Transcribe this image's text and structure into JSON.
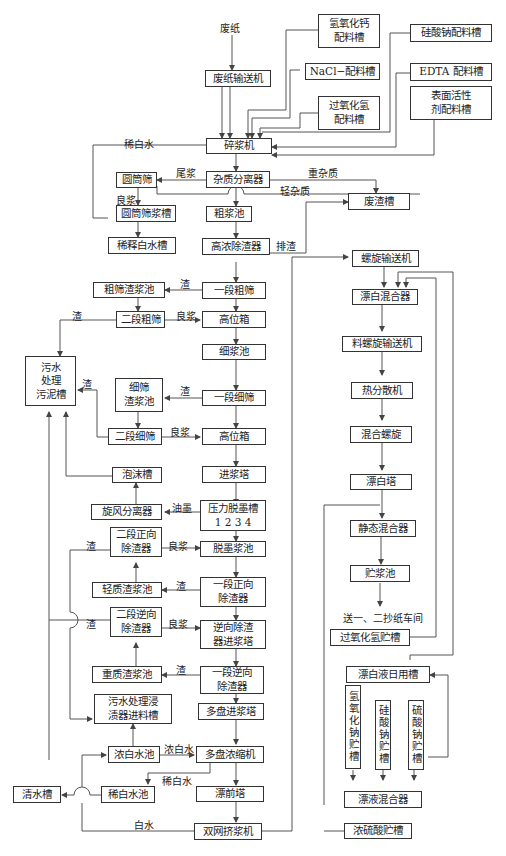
{
  "diagram": {
    "type": "process-flow"
  },
  "inputs": {
    "waste_paper": "废纸",
    "calcium_hydroxide_tank": "氢氧化钙\n配料槽",
    "sodium_silicate_tank": "硅酸钠配料槽",
    "nacl_tank": "NaCl−配料槽",
    "edta_tank": "EDTA 配料槽",
    "hydrogen_peroxide_tank": "过氧化氢\n配料槽",
    "surfactant_tank": "表面活性\n剂配料槽"
  },
  "left_chain": {
    "waste_paper_conveyor": "废纸输送机",
    "pulper": "碎浆机",
    "impurity_separator": "杂质分离器",
    "drum_screen": "圆筒筛",
    "drum_screen_chest": "圆筒筛浆槽",
    "dilution_water_tank": "稀释白水槽",
    "crude_pulp_pool": "粗浆池",
    "hd_cleaner": "高浓除渣器",
    "waste_residue_tank": "废渣槽",
    "coarse_screen_1": "一段粗筛",
    "coarse_reject_pool": "粗筛渣浆池",
    "coarse_screen_2": "二段粗筛",
    "headbox_1": "高位箱",
    "fine_pulp_pool": "细浆池",
    "sludge_tank": "污水\n处理\n污泥槽",
    "fine_reject_pool": "细筛\n渣浆池",
    "fine_screen_1": "一段细筛",
    "fine_screen_2": "二段细筛",
    "headbox_2": "高位箱",
    "feed_tower": "进浆塔",
    "foam_tank": "泡沫槽",
    "cyclone": "旋风分离器",
    "flotation_cell": "压力脱墨槽\n1 2 3 4",
    "forward_cleaner_2": "二段正向\n除渣器",
    "deinked_pool": "脱墨浆池",
    "light_reject_pool": "轻质渣浆池",
    "forward_cleaner_1": "一段正向\n除渣器",
    "reverse_cleaner_2": "二段逆向\n除渣器",
    "reverse_feed_tower": "逆向除渣\n器进浆塔",
    "heavy_reject_pool": "重质渣浆池",
    "reverse_cleaner_1": "一段逆向\n除渣器",
    "wastewater_feed_tank": "污水处理浸\n渍器进料槽",
    "disc_feed_tower": "多盘进浆塔",
    "rich_whitewater_pool": "浓白水池",
    "disc_thickener": "多盘浓缩机",
    "clear_water_tank": "清水槽",
    "lean_whitewater_pool": "稀白水池",
    "pre_bleach_tower": "漂前塔",
    "twin_wire_press": "双网挤浆机"
  },
  "right_chain": {
    "screw_conveyor": "螺旋输送机",
    "bleach_mixer": "漂白混合器",
    "feed_screw_conveyor": "料螺旋输送机",
    "heat_disperser": "热分散机",
    "mixing_screw": "混合螺旋",
    "bleach_tower": "漂白塔",
    "static_mixer": "静态混合器",
    "storage_pool": "贮浆池",
    "to_paper_machines": "送一、二抄纸车间",
    "h2o2_storage": "过氧化氢贮槽",
    "bleach_day_tank": "漂白液日用槽",
    "naoh_storage": "氢氧化钠贮槽",
    "silicate_storage": "硅酸钠贮槽",
    "sulfate_storage": "硫酸钠贮槽",
    "bleach_liquor_mixer": "漂液混合器",
    "conc_acid_storage": "浓硫酸贮槽"
  },
  "labels": {
    "dilute_whitewater": "稀白水",
    "tail_pulp": "尾浆",
    "heavy_impurity": "重杂质",
    "light_impurity": "轻杂质",
    "accept_1": "良浆",
    "reject_out": "排渣",
    "reject_a": "渣",
    "reject_b": "渣",
    "accept_2": "良浆",
    "reject_c": "渣",
    "reject_d": "渣",
    "accept_3": "良浆",
    "ink": "油墨",
    "reject_e": "渣",
    "accept_4": "良浆",
    "reject_f": "渣",
    "reject_g": "渣",
    "accept_5": "良浆",
    "reject_h": "渣",
    "rich_whitewater": "浓白水",
    "lean_whitewater": "稀白水",
    "whitewater": "白水"
  }
}
